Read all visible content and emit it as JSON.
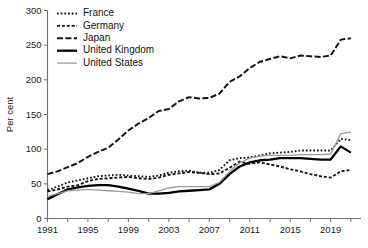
{
  "chart_data": {
    "type": "line",
    "title": "",
    "subtitle": "",
    "xlabel": "",
    "ylabel": "Per cent",
    "xlim": [
      1991,
      2022
    ],
    "ylim": [
      0,
      300
    ],
    "yticks": [
      0,
      50,
      100,
      150,
      200,
      250,
      300
    ],
    "xticks": [
      1991,
      1995,
      1999,
      2003,
      2007,
      2011,
      2015,
      2019
    ],
    "xtick_minor_step": 2,
    "grid": false,
    "legend_position": "top-left",
    "x": [
      1991,
      1992,
      1993,
      1994,
      1995,
      1996,
      1997,
      1998,
      1999,
      2000,
      2001,
      2002,
      2003,
      2004,
      2005,
      2006,
      2007,
      2008,
      2009,
      2010,
      2011,
      2012,
      2013,
      2014,
      2015,
      2016,
      2017,
      2018,
      2019,
      2020,
      2021
    ],
    "series": [
      {
        "name": "France",
        "style": "dotted",
        "color": "#141414",
        "values": [
          41,
          46,
          52,
          55,
          58,
          61,
          62,
          63,
          62,
          61,
          60,
          62,
          66,
          68,
          69,
          66,
          66,
          70,
          84,
          87,
          88,
          91,
          94,
          95,
          96,
          98,
          98,
          98,
          98,
          115,
          113
        ]
      },
      {
        "name": "Germany",
        "style": "dashed-fine",
        "color": "#141414",
        "values": [
          39,
          42,
          46,
          48,
          54,
          57,
          58,
          59,
          60,
          58,
          57,
          59,
          63,
          65,
          67,
          66,
          64,
          65,
          73,
          82,
          79,
          81,
          78,
          75,
          71,
          68,
          64,
          61,
          59,
          68,
          70
        ]
      },
      {
        "name": "Japan",
        "style": "dash-dot",
        "color": "#141414",
        "values": [
          64,
          68,
          74,
          80,
          89,
          96,
          102,
          114,
          127,
          137,
          145,
          155,
          158,
          169,
          175,
          173,
          174,
          180,
          197,
          205,
          217,
          226,
          230,
          234,
          231,
          235,
          234,
          233,
          235,
          258,
          260
        ]
      },
      {
        "name": "United Kingdom",
        "style": "solid-thick",
        "color": "#000000",
        "values": [
          28,
          35,
          42,
          45,
          47,
          48,
          48,
          46,
          43,
          40,
          36,
          36,
          37,
          39,
          40,
          41,
          42,
          50,
          64,
          75,
          81,
          84,
          85,
          87,
          87,
          87,
          86,
          85,
          85,
          104,
          95
        ]
      },
      {
        "name": "United States",
        "style": "solid-thin",
        "color": "#9a9a9a",
        "values": [
          32,
          36,
          40,
          41,
          42,
          41,
          40,
          39,
          38,
          36,
          36,
          40,
          44,
          46,
          46,
          46,
          46,
          52,
          68,
          80,
          87,
          90,
          91,
          91,
          91,
          92,
          92,
          92,
          93,
          122,
          125
        ]
      }
    ]
  },
  "legend": {
    "items": [
      {
        "label": "France"
      },
      {
        "label": "Germany"
      },
      {
        "label": "Japan"
      },
      {
        "label": "United Kingdom"
      },
      {
        "label": "United States"
      }
    ]
  },
  "axes": {
    "ylabel": "Per cent",
    "ytick_labels": [
      "0",
      "50",
      "100",
      "150",
      "200",
      "250",
      "300"
    ],
    "xtick_labels": [
      "1991",
      "1995",
      "1999",
      "2003",
      "2007",
      "2011",
      "2015",
      "2019"
    ]
  }
}
